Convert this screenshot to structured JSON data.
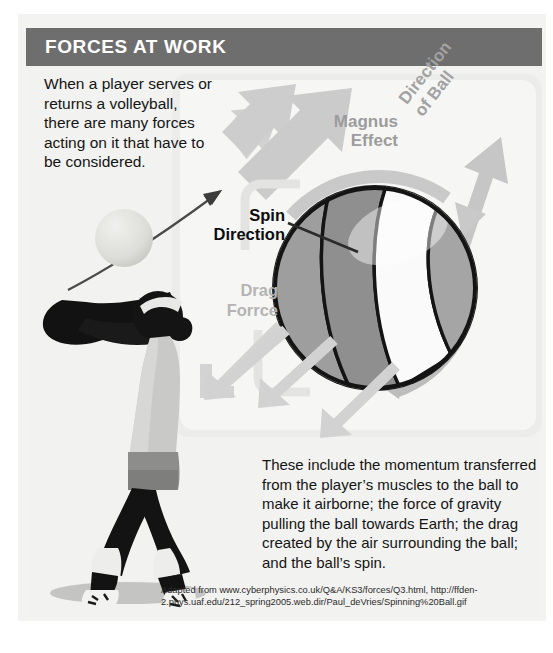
{
  "header": {
    "title": "FORCES AT WORK",
    "bar_color": "#6e6e6e",
    "title_color": "#ffffff"
  },
  "intro": {
    "text": "When a player serves or returns a volleyball, there are many forces acting on it that  have to be considered."
  },
  "body": {
    "text": "These include the momentum transferred from the player’s muscles to the ball to make it airborne; the force of gravity pulling the ball towards Earth; the drag created by the air surrounding the ball; and the ball’s spin."
  },
  "attribution": {
    "line1": "Adapted from www.cyberphysics.co.uk/Q&A/KS3/forces/Q3.html, http://ffden-",
    "line2": "2.phys.uaf.edu/212_spring2005.web.dir/Paul_deVries/Spinning%20Ball.gif"
  },
  "diagram": {
    "panel_color": "#f6f6f5",
    "labels": {
      "magnus_line1": "Magnus",
      "magnus_line2": "Effect",
      "magnus_color": "#9c9c9c",
      "direction_line1": "Direction",
      "direction_line2": "of Ball",
      "direction_color": "#a2a2a2",
      "spin_line1": "Spin",
      "spin_line2": "Direction",
      "spin_color": "#0d0d0d",
      "drag_line1": "Drag",
      "drag_line2": "Forrce",
      "drag_color": "#b4b4b4"
    },
    "elements": {
      "volleyball": "volleyball-illustration",
      "player": "player-silhouette",
      "served_ball": "small-ball",
      "trajectory_arrow": "trajectory-arrow",
      "magnus_arrow": "magnus-arrow-up-left",
      "direction_arrow": "direction-arrow-up-right",
      "spin_arrow": "spin-rotation-arc",
      "drag_arrows": "drag-arrows-down-left"
    }
  }
}
